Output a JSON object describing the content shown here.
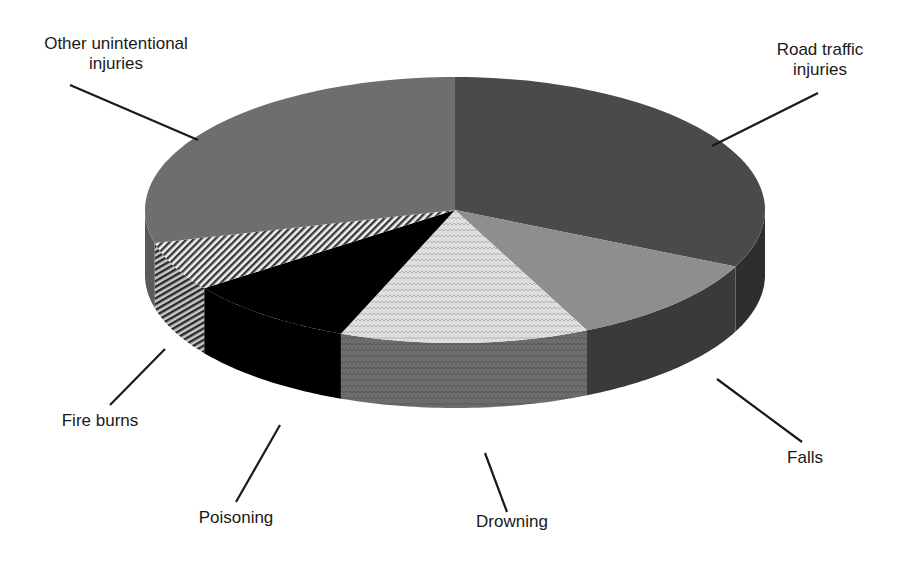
{
  "chart_data": {
    "type": "pie",
    "style": "3d",
    "title": "",
    "categories": [
      "Road traffic injuries",
      "Falls",
      "Drowning",
      "Poisoning",
      "Fire burns",
      "Other unintentional injuries"
    ],
    "values": [
      32,
      11,
      13,
      9,
      6,
      29
    ],
    "units": "approximate share (%) estimated from slice angles",
    "fills": [
      "#4a4a4a",
      "#8e8e8e",
      "#dcdcdc",
      "#000000",
      "hatch",
      "#6e6e6e"
    ],
    "side_fills": [
      "#2e2e2e",
      "#3a3a3a",
      "#6a6a6a",
      "#000000",
      "hatch",
      "#5a5a5a"
    ],
    "legend": "none (leader-line labels)"
  },
  "labels": {
    "road": [
      "Road traffic",
      "injuries"
    ],
    "falls": "Falls",
    "drowning": "Drowning",
    "poisoning": "Poisoning",
    "fire": "Fire burns",
    "other": [
      "Other unintentional",
      "injuries"
    ]
  }
}
